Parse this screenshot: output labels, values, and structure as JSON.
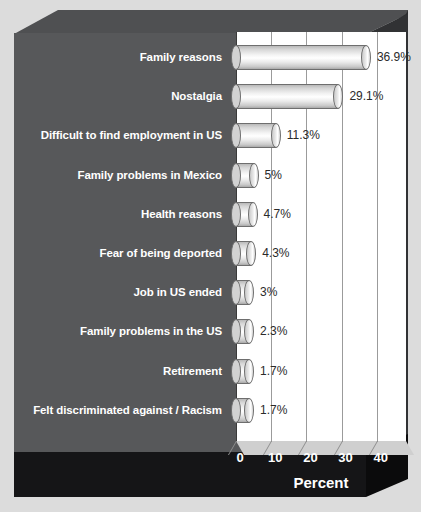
{
  "chart_data": {
    "type": "bar",
    "orientation": "horizontal",
    "title": "",
    "xlabel": "Percent",
    "ylabel": "",
    "xlim": [
      0,
      47
    ],
    "xticks": [
      0,
      10,
      20,
      30,
      40
    ],
    "xtick_labels": [
      "0",
      "10",
      "20",
      "30",
      "40"
    ],
    "grid": true,
    "legend": false,
    "categories": [
      "Family reasons",
      "Nostalgia",
      "Difficult to find employment in US",
      "Family problems in Mexico",
      "Health reasons",
      "Fear of being deported",
      "Job in US ended",
      "Family problems in the US",
      "Retirement",
      "Felt discriminated against / Racism"
    ],
    "values": [
      36.9,
      29.1,
      11.3,
      5,
      4.7,
      4.3,
      3,
      2.3,
      1.7,
      1.7
    ],
    "value_labels": [
      "36.9%",
      "29.1%",
      "11.3%",
      "5%",
      "4.7%",
      "4.3%",
      "3%",
      "2.3%",
      "1.7%",
      "1.7%"
    ],
    "colors": {
      "background": "#dcdcdc",
      "wall": "#57585a",
      "wall_top": "#4f5052",
      "wall_side": "#313234",
      "base": "#151517",
      "plot_area": "#ffffff",
      "gridline": "#9b9b9b",
      "bar_fill": "#efefef",
      "bar_outline": "#6e6e6e",
      "category_text": "#ffffff",
      "value_text": "#2a2a2a",
      "tick_text": "#ffffff"
    }
  }
}
